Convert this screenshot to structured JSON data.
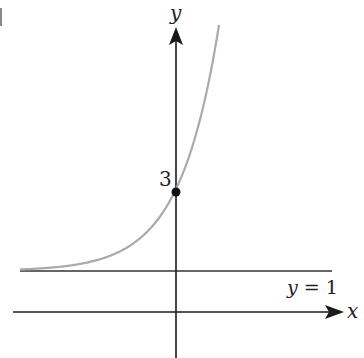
{
  "diagram": {
    "title": "",
    "axes": {
      "x_label": "x",
      "y_label": "y"
    },
    "point": {
      "label": "3",
      "x": 0,
      "y": 3
    },
    "asymptote": {
      "label": "y = 1",
      "value": 1
    },
    "curve": {
      "description": "exponential growth curve approaching y = 1 as x → −∞, passing through (0, 3)",
      "color": "#aaaaaa"
    },
    "colors": {
      "axis": "#1a1a1a",
      "curve": "#aaaaaa",
      "asymptote": "#333333"
    }
  }
}
